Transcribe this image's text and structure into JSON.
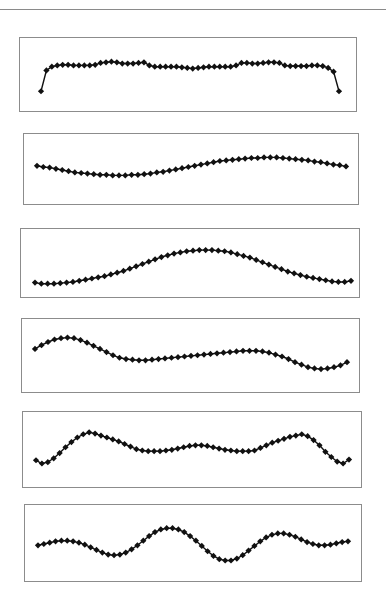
{
  "page": {
    "background": "#ffffff",
    "rule_color": "#8a8a8a",
    "line_color": "#111111",
    "marker_color": "#111111"
  },
  "chart_data": [
    {
      "type": "line",
      "title": "",
      "xlabel": "",
      "ylabel": "",
      "grid": false,
      "legend": null,
      "box": {
        "x": 19,
        "y": 37,
        "w": 338,
        "h": 75
      },
      "x_range": [
        40,
        338
      ],
      "ylim": [
        0,
        100
      ],
      "values": [
        25,
        58,
        64,
        66,
        67,
        67,
        66,
        66,
        66,
        66,
        67,
        70,
        71,
        72,
        71,
        69,
        69,
        69,
        70,
        71,
        66,
        64,
        64,
        64,
        64,
        64,
        63,
        62,
        61,
        62,
        63,
        64,
        64,
        64,
        64,
        64,
        66,
        70,
        70,
        69,
        69,
        70,
        71,
        71,
        70,
        66,
        65,
        65,
        65,
        65,
        66,
        66,
        65,
        62,
        56,
        25
      ]
    },
    {
      "type": "line",
      "title": "",
      "xlabel": "",
      "ylabel": "",
      "grid": false,
      "legend": null,
      "box": {
        "x": 23,
        "y": 133,
        "w": 336,
        "h": 72
      },
      "x_range": [
        36,
        345
      ],
      "ylim": [
        0,
        100
      ],
      "values": [
        57,
        55,
        54,
        52,
        50,
        48,
        46,
        45,
        44,
        43,
        42,
        42,
        41,
        41,
        41,
        42,
        42,
        43,
        44,
        46,
        47,
        49,
        51,
        53,
        55,
        57,
        59,
        61,
        63,
        65,
        66,
        67,
        68,
        69,
        70,
        70,
        71,
        71,
        71,
        70,
        69,
        68,
        67,
        66,
        64,
        63,
        61,
        59,
        58,
        56
      ]
    },
    {
      "type": "line",
      "title": "",
      "xlabel": "",
      "ylabel": "",
      "grid": false,
      "legend": null,
      "box": {
        "x": 20,
        "y": 228,
        "w": 340,
        "h": 70
      },
      "x_range": [
        34,
        350
      ],
      "ylim": [
        0,
        100
      ],
      "values": [
        18,
        16,
        16,
        16,
        17,
        18,
        19,
        21,
        23,
        25,
        27,
        29,
        32,
        35,
        38,
        42,
        46,
        50,
        54,
        58,
        62,
        65,
        68,
        70,
        72,
        73,
        74,
        74,
        74,
        73,
        72,
        70,
        67,
        64,
        61,
        57,
        53,
        49,
        45,
        41,
        37,
        34,
        31,
        28,
        26,
        24,
        22,
        20,
        19,
        19,
        21
      ]
    },
    {
      "type": "line",
      "title": "",
      "xlabel": "",
      "ylabel": "",
      "grid": false,
      "legend": null,
      "box": {
        "x": 21,
        "y": 318,
        "w": 339,
        "h": 75
      },
      "x_range": [
        34,
        346
      ],
      "ylim": [
        0,
        100
      ],
      "values": [
        62,
        68,
        73,
        77,
        79,
        80,
        79,
        76,
        72,
        67,
        62,
        57,
        52,
        48,
        46,
        45,
        44,
        44,
        45,
        46,
        47,
        48,
        49,
        50,
        51,
        52,
        53,
        54,
        55,
        56,
        57,
        58,
        59,
        59,
        59,
        58,
        56,
        53,
        50,
        46,
        41,
        37,
        33,
        31,
        30,
        31,
        33,
        36,
        41
      ]
    },
    {
      "type": "line",
      "title": "",
      "xlabel": "",
      "ylabel": "",
      "grid": false,
      "legend": null,
      "box": {
        "x": 22,
        "y": 411,
        "w": 340,
        "h": 77
      },
      "x_range": [
        35,
        348
      ],
      "ylim": [
        0,
        100
      ],
      "values": [
        35,
        30,
        32,
        38,
        46,
        55,
        63,
        70,
        75,
        78,
        76,
        73,
        70,
        67,
        64,
        60,
        56,
        52,
        50,
        49,
        49,
        49,
        50,
        51,
        53,
        55,
        57,
        58,
        58,
        57,
        55,
        53,
        51,
        50,
        49,
        49,
        49,
        50,
        54,
        58,
        62,
        65,
        68,
        71,
        73,
        75,
        72,
        66,
        58,
        48,
        40,
        33,
        30,
        36
      ]
    },
    {
      "type": "line",
      "title": "",
      "xlabel": "",
      "ylabel": "",
      "grid": false,
      "legend": null,
      "box": {
        "x": 24,
        "y": 504,
        "w": 338,
        "h": 78
      },
      "x_range": [
        37,
        347
      ],
      "ylim": [
        0,
        100
      ],
      "values": [
        48,
        50,
        52,
        54,
        55,
        55,
        54,
        52,
        49,
        45,
        41,
        37,
        34,
        33,
        34,
        37,
        42,
        48,
        55,
        62,
        68,
        72,
        74,
        74,
        72,
        68,
        62,
        55,
        47,
        39,
        32,
        27,
        25,
        25,
        28,
        33,
        40,
        47,
        54,
        60,
        64,
        66,
        66,
        64,
        61,
        57,
        53,
        50,
        48,
        48,
        49,
        51,
        53,
        54
      ]
    }
  ]
}
